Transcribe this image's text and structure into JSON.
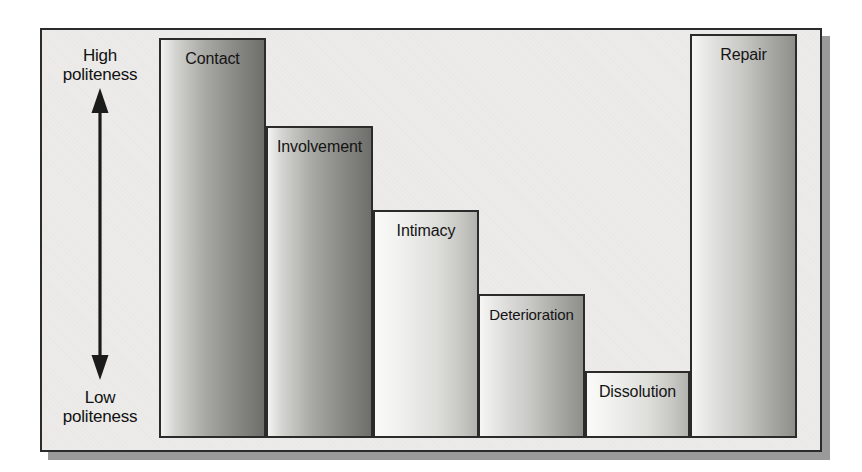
{
  "figure": {
    "kind": "stepped-bar-diagram",
    "axis": {
      "high_label": "High\npoliteness",
      "high_label_line1": "High",
      "high_label_line2": "politeness",
      "low_label_line1": "Low",
      "low_label_line2": "politeness",
      "arrow_icon": "double-headed-vertical-arrow"
    },
    "frame_color": "#2b2b2b",
    "background_color": "#ecebe9"
  },
  "chart_data": {
    "type": "bar",
    "title": "",
    "subtitle": "",
    "xlabel": "",
    "ylabel": "Politeness",
    "ylim": [
      0,
      100
    ],
    "grid": false,
    "legend": false,
    "categories": [
      "Contact",
      "Involvement",
      "Intimacy",
      "Deterioration",
      "Dissolution",
      "Repair"
    ],
    "values": [
      100,
      78,
      57,
      36,
      16,
      101
    ],
    "annotations": [
      "High politeness",
      "Low politeness"
    ]
  },
  "bars": [
    {
      "label": "Contact",
      "left": 117,
      "top": 8,
      "width": 107,
      "height": 400,
      "shade": "dark"
    },
    {
      "label": "Involvement",
      "left": 224,
      "top": 96,
      "width": 107,
      "height": 312,
      "shade": "dark"
    },
    {
      "label": "Intimacy",
      "left": 331,
      "top": 180,
      "width": 106,
      "height": 228,
      "shade": "light"
    },
    {
      "label": "Deterioration",
      "left": 436,
      "top": 264,
      "width": 107,
      "height": 144,
      "shade": "normal"
    },
    {
      "label": "Dissolution",
      "left": 543,
      "top": 341,
      "width": 105,
      "height": 67,
      "shade": "light"
    },
    {
      "label": "Repair",
      "left": 648,
      "top": 4,
      "width": 107,
      "height": 404,
      "shade": "normal"
    }
  ]
}
